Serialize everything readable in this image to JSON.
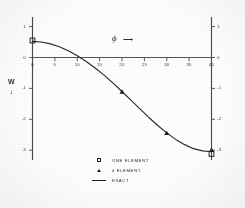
{
  "figure": {
    "background_color": "#fdfdfc",
    "ink_color": "#1d1d1b"
  },
  "axis_titles": {
    "x_symbol": "ϕ",
    "x_arrow": "⟶",
    "y_symbol": "W",
    "y_arrow": "↓"
  },
  "legend": {
    "entries": [
      {
        "symbol": "square",
        "label": "ONE ELEMENT"
      },
      {
        "symbol": "triangle",
        "label": "4  ELEMENT"
      },
      {
        "symbol": "line",
        "label": "EXACT"
      }
    ]
  },
  "chart_data": {
    "type": "line",
    "title": "",
    "subtitle": "",
    "xlabel": "ϕ",
    "ylabel": "W",
    "xlim": [
      0,
      40
    ],
    "ylim": [
      -3.4,
      1.2
    ],
    "grid": false,
    "legend_position": "bottom-center",
    "xticks": [
      0,
      5,
      10,
      15,
      20,
      25,
      30,
      35,
      40
    ],
    "xticklabels": [
      "0",
      "5",
      "10",
      "15",
      "20",
      "25",
      "30",
      "35",
      "40"
    ],
    "yticks": [
      1,
      0,
      -1,
      -2,
      -3
    ],
    "yticklabels_left": [
      "1",
      "0",
      "-1",
      "-2",
      "-3"
    ],
    "yticklabels_right": [
      "1",
      "0",
      "-1",
      "-2",
      "-3"
    ],
    "y_axis_direction": "downward-positive",
    "x_axis_drawn_at_y": 0,
    "left_axis_at_x": 0,
    "right_axis_at_x": 40,
    "series": [
      {
        "name": "EXACT",
        "type": "line",
        "x": [
          0,
          2,
          4,
          6,
          8,
          10,
          12,
          14,
          16,
          18,
          20,
          22,
          24,
          26,
          28,
          30,
          32,
          34,
          36,
          38,
          40
        ],
        "y": [
          0.52,
          0.5,
          0.44,
          0.35,
          0.22,
          0.06,
          -0.13,
          -0.34,
          -0.57,
          -0.83,
          -1.1,
          -1.38,
          -1.66,
          -1.94,
          -2.2,
          -2.44,
          -2.65,
          -2.82,
          -2.95,
          -3.02,
          -3.05
        ]
      },
      {
        "name": "ONE ELEMENT",
        "type": "scatter",
        "marker": "square",
        "x": [
          0,
          40
        ],
        "y": [
          0.55,
          -3.12
        ]
      },
      {
        "name": "4 ELEMENT",
        "type": "scatter",
        "marker": "triangle",
        "x": [
          20,
          30,
          40
        ],
        "y": [
          -1.1,
          -2.44,
          -2.98
        ]
      }
    ],
    "zero_crossing_x": 11.0
  }
}
